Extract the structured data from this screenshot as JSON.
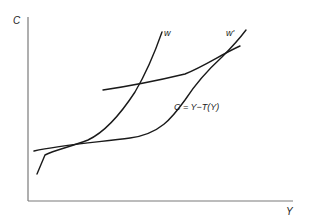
{
  "diagram": {
    "axes": {
      "y_label": "C",
      "x_label": "Y",
      "color": "#777777"
    },
    "curves": [
      {
        "id": "w",
        "label": "w",
        "description": "steep indifference curve"
      },
      {
        "id": "w_prime",
        "label": "w'",
        "description": "indifference curve"
      },
      {
        "id": "budget",
        "label": "C = Y−T(Y)",
        "description": "budget constraint"
      }
    ],
    "line_color": "#1a1a1a",
    "background": "#ffffff"
  }
}
